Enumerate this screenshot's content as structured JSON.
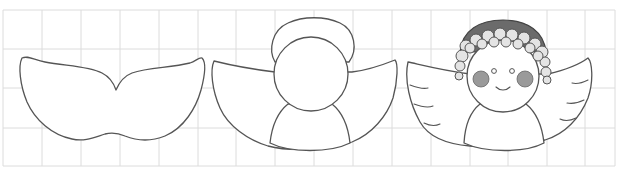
{
  "figure": {
    "grid": {
      "cell_size_px": 39,
      "origin_x": 3,
      "origin_y": 10,
      "cols": 16,
      "rows": 4,
      "line_color": "#dcdcdc"
    },
    "steps": [
      {
        "index": 1,
        "name": "wings-outline"
      },
      {
        "index": 2,
        "name": "wings-head-halo-body"
      },
      {
        "index": 3,
        "name": "finished-angel"
      }
    ],
    "colors": {
      "background": "#ffffff",
      "ink": "#555555",
      "hair_cap": "#6b6b6b",
      "hair_curl": "#e4e4e4",
      "cheeks": "#9a9a9a"
    }
  }
}
